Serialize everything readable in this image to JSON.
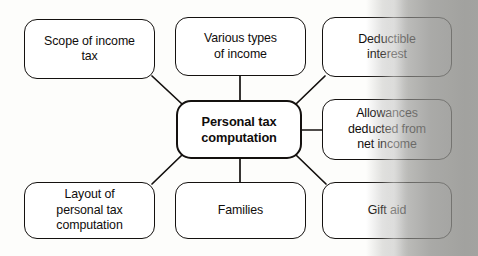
{
  "diagram": {
    "type": "mind-map",
    "central": {
      "label": "Personal tax\ncomputation",
      "x": 176,
      "y": 100,
      "w": 126,
      "h": 59
    },
    "nodes": [
      {
        "name": "scope-of-income-tax",
        "label": "Scope of income\ntax",
        "x": 24,
        "y": 19,
        "w": 131,
        "h": 60
      },
      {
        "name": "various-types-of-income",
        "label": "Various types\nof income",
        "x": 175,
        "y": 17,
        "w": 131,
        "h": 59
      },
      {
        "name": "deductible-interest",
        "label": "Deductible\ninterest",
        "x": 322,
        "y": 17,
        "w": 130,
        "h": 60
      },
      {
        "name": "allowances-deducted",
        "label": "Allowances\ndeducted from\nnet income",
        "x": 322,
        "y": 99,
        "w": 130,
        "h": 61
      },
      {
        "name": "gift-aid",
        "label": "Gift aid",
        "x": 322,
        "y": 182,
        "w": 130,
        "h": 57
      },
      {
        "name": "families",
        "label": "Families",
        "x": 175,
        "y": 182,
        "w": 131,
        "h": 57
      },
      {
        "name": "layout-of-personal-tax",
        "label": "Layout of\npersonal tax\ncomputation",
        "x": 24,
        "y": 182,
        "w": 131,
        "h": 57
      }
    ],
    "connectors": [
      {
        "name": "link-scope-to-central",
        "from": "scope-of-income-tax",
        "x1": 152,
        "y1": 76,
        "x2": 182,
        "y2": 104,
        "style": "diagonal"
      },
      {
        "name": "link-various-to-central",
        "from": "various-types-of-income",
        "x1": 240,
        "y1": 76,
        "x2": 240,
        "y2": 100,
        "style": "vertical"
      },
      {
        "name": "link-deductible-to-central",
        "from": "deductible-interest",
        "x1": 325,
        "y1": 76,
        "x2": 296,
        "y2": 104,
        "style": "diagonal"
      },
      {
        "name": "link-allowances-to-central",
        "from": "allowances-deducted",
        "x1": 302,
        "y1": 130,
        "x2": 322,
        "y2": 130,
        "style": "horizontal"
      },
      {
        "name": "link-giftaid-to-central",
        "from": "gift-aid",
        "x1": 296,
        "y1": 155,
        "x2": 326,
        "y2": 184,
        "style": "diagonal"
      },
      {
        "name": "link-families-to-central",
        "from": "families",
        "x1": 240,
        "y1": 159,
        "x2": 240,
        "y2": 182,
        "style": "vertical"
      },
      {
        "name": "link-layout-to-central",
        "from": "layout-of-personal-tax",
        "x1": 182,
        "y1": 155,
        "x2": 152,
        "y2": 184,
        "style": "diagonal"
      }
    ],
    "colors": {
      "stroke": "#14110f",
      "node_fill": "#ffffff",
      "text": "#100d0b",
      "page_shadow": "#92928f"
    }
  }
}
